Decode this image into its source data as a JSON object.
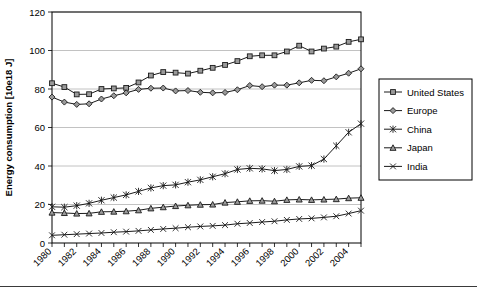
{
  "chart_data": {
    "type": "line",
    "title": "",
    "xlabel": "",
    "ylabel": "Energy consumption [10e18 J]",
    "xlim": [
      1980,
      2005
    ],
    "ylim": [
      0,
      120
    ],
    "ytick_step": 20,
    "yticks": [
      0,
      20,
      40,
      60,
      80,
      100,
      120
    ],
    "ytick_labels": [
      "0",
      "20",
      "40",
      "60",
      "80",
      "100",
      "120"
    ],
    "x": [
      1980,
      1981,
      1982,
      1983,
      1984,
      1985,
      1986,
      1987,
      1988,
      1989,
      1990,
      1991,
      1992,
      1993,
      1994,
      1995,
      1996,
      1997,
      1998,
      1999,
      2000,
      2001,
      2002,
      2003,
      2004,
      2005
    ],
    "xtick_labels": [
      "1980",
      "1982",
      "1984",
      "1986",
      "1988",
      "1990",
      "1992",
      "1994",
      "1996",
      "1998",
      "2000",
      "2002",
      "2004"
    ],
    "xtick_values": [
      1980,
      1982,
      1984,
      1986,
      1988,
      1990,
      1992,
      1994,
      1996,
      1998,
      2000,
      2002,
      2004
    ],
    "grid": true,
    "grid_axis": "y",
    "legend_position": "right",
    "series": [
      {
        "name": "United States",
        "marker": "square",
        "values": [
          83.0,
          81.0,
          77.2,
          77.3,
          80.0,
          80.3,
          80.6,
          83.4,
          87.0,
          88.8,
          88.5,
          88.0,
          89.5,
          91.0,
          92.5,
          94.5,
          97.0,
          97.5,
          97.5,
          99.5,
          102.5,
          99.5,
          101.0,
          102.0,
          104.5,
          105.8
        ]
      },
      {
        "name": "Europe",
        "marker": "diamond",
        "values": [
          75.8,
          73.2,
          72.0,
          72.3,
          74.8,
          76.5,
          78.0,
          79.8,
          80.4,
          80.5,
          79.0,
          79.2,
          78.3,
          78.0,
          78.2,
          79.6,
          81.8,
          81.2,
          82.0,
          82.0,
          83.2,
          84.5,
          84.3,
          86.3,
          88.2,
          90.5
        ]
      },
      {
        "name": "China",
        "marker": "asterisk",
        "values": [
          18.8,
          18.6,
          19.4,
          20.6,
          22.2,
          23.6,
          25.0,
          26.8,
          28.6,
          29.8,
          30.2,
          31.6,
          32.8,
          34.4,
          36.0,
          38.2,
          38.8,
          38.5,
          37.6,
          38.2,
          39.8,
          40.2,
          43.6,
          50.5,
          57.5,
          62.0
        ]
      },
      {
        "name": "Japan",
        "marker": "triangle",
        "values": [
          15.8,
          15.6,
          15.3,
          15.4,
          16.2,
          16.3,
          16.5,
          17.0,
          18.0,
          18.6,
          19.2,
          19.6,
          19.9,
          20.0,
          21.0,
          21.4,
          21.9,
          22.0,
          21.7,
          22.4,
          22.6,
          22.4,
          22.6,
          22.8,
          23.3,
          23.5
        ]
      },
      {
        "name": "India",
        "marker": "cross",
        "values": [
          4.0,
          4.3,
          4.6,
          4.9,
          5.2,
          5.6,
          5.9,
          6.3,
          6.8,
          7.3,
          7.7,
          8.2,
          8.6,
          8.9,
          9.3,
          10.0,
          10.4,
          10.9,
          11.3,
          12.0,
          12.5,
          12.8,
          13.3,
          13.9,
          15.3,
          16.8
        ]
      }
    ]
  },
  "legend": {
    "items": [
      {
        "label": "United States"
      },
      {
        "label": "Europe"
      },
      {
        "label": "China"
      },
      {
        "label": "Japan"
      },
      {
        "label": "India"
      }
    ]
  }
}
